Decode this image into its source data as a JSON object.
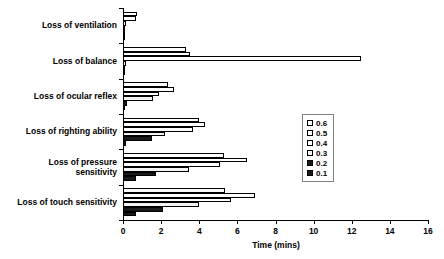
{
  "chart_data": {
    "type": "bar",
    "orientation": "horizontal",
    "title": "",
    "xlabel": "Time (mins)",
    "ylabel": "",
    "xlim": [
      0,
      16
    ],
    "xticks": [
      0,
      2,
      4,
      6,
      8,
      10,
      12,
      14,
      16
    ],
    "grid": false,
    "legend_position": "right-middle",
    "legend_title": "",
    "categories": [
      "Loss of ventilation",
      "Loss of balance",
      "Loss of ocular reflex",
      "Loss of righting ability",
      "Loss of pressure\nsensitivity",
      "Loss of touch sensitivity"
    ],
    "series": [
      {
        "name": "0.6",
        "fill": "white",
        "values": [
          0.75,
          3.3,
          2.35,
          4.0,
          5.3,
          5.35
        ]
      },
      {
        "name": "0.5",
        "fill": "white",
        "values": [
          0.7,
          3.5,
          2.65,
          4.3,
          6.5,
          6.9
        ]
      },
      {
        "name": "0.4",
        "fill": "white",
        "values": [
          0.15,
          12.5,
          1.9,
          3.65,
          5.1,
          5.65
        ]
      },
      {
        "name": "0.3",
        "fill": "light",
        "values": [
          0.1,
          0.15,
          1.55,
          2.2,
          3.45,
          4.0
        ]
      },
      {
        "name": "0.2",
        "fill": "black",
        "values": [
          0.1,
          0.1,
          0.2,
          1.5,
          1.75,
          2.1
        ]
      },
      {
        "name": "0.1",
        "fill": "black",
        "values": [
          0.1,
          0.1,
          0.1,
          0.15,
          0.7,
          0.7
        ]
      }
    ]
  },
  "legend": {
    "entries": [
      {
        "label": "0.6",
        "fill": "white"
      },
      {
        "label": "0.5",
        "fill": "white"
      },
      {
        "label": "0.4",
        "fill": "white"
      },
      {
        "label": "0.3",
        "fill": "light"
      },
      {
        "label": "0.2",
        "fill": "black"
      },
      {
        "label": "0.1",
        "fill": "black"
      }
    ]
  },
  "colors": {
    "axis": "#000000",
    "bar_outline": "#000000",
    "fill_white": "#ffffff",
    "fill_light": "#f2f2f2",
    "fill_gray": "#d9d9d9",
    "fill_black": "#1a1a1a",
    "legend_border": "#808080",
    "background": "#ffffff"
  }
}
